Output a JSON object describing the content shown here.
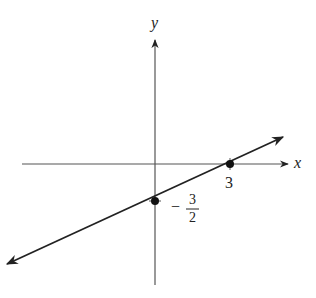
{
  "diagram": {
    "type": "coordinate-graph",
    "axes": {
      "x_label": "x",
      "y_label": "y"
    },
    "line": {
      "equation": "y = x/2 - 3/2",
      "slope": 0.5,
      "x_intercept": 3,
      "y_intercept": -1.5
    },
    "points": [
      {
        "x": 3,
        "y": 0,
        "label": "3"
      },
      {
        "x": 0,
        "y": -1.5,
        "label_sign": "−",
        "label_num": "3",
        "label_den": "2"
      }
    ],
    "colors": {
      "axis": "#555555",
      "line": "#222222",
      "points": "#111111"
    }
  }
}
